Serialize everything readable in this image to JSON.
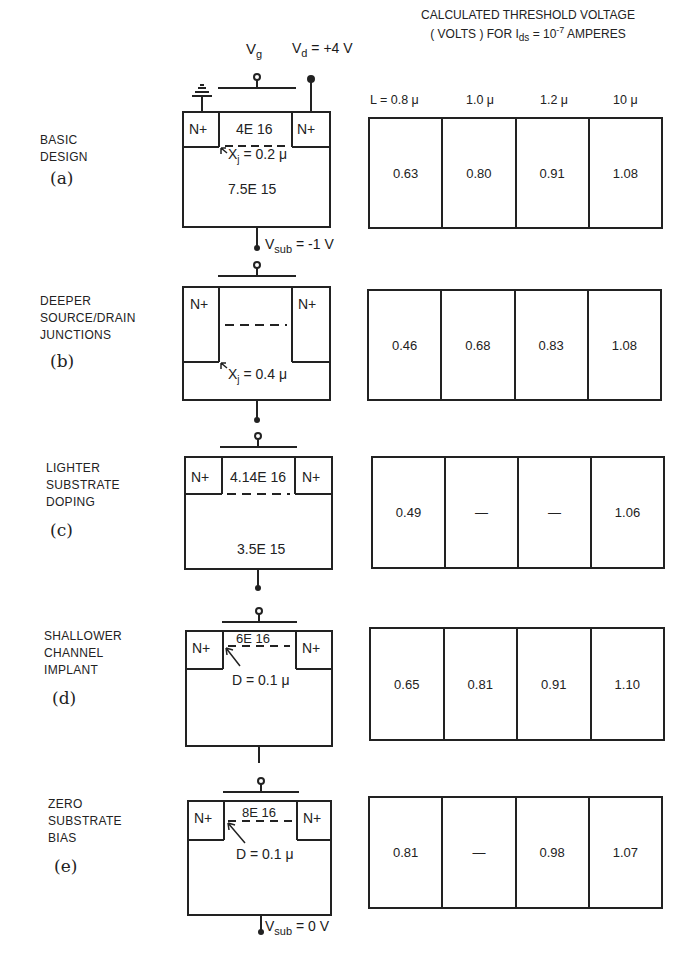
{
  "header": {
    "line1": "CALCULATED THRESHOLD VOLTAGE",
    "line2_prefix": "( VOLTS ) FOR  I",
    "line2_sub": "ds",
    "line2_mid": " = 10",
    "line2_sup": "-7",
    "line2_suffix": " AMPERES"
  },
  "columns": [
    "L = 0.8 μ",
    "1.0 μ",
    "1.2 μ",
    "10 μ"
  ],
  "terminals": {
    "vg": "V",
    "vg_sub": "g",
    "vd": "V",
    "vd_sub": "d",
    "vd_value": " = +4 V",
    "vsub_a": "V",
    "vsub_a_sub": "sub",
    "vsub_a_value": " = -1 V",
    "vsub_e": "V",
    "vsub_e_sub": "sub",
    "vsub_e_value": " = 0 V"
  },
  "rows": [
    {
      "id": "a",
      "title_lines": [
        "BASIC",
        "DESIGN"
      ],
      "tag": "(a)",
      "device": {
        "source": "N+",
        "drain": "N+",
        "channel": "4E 16",
        "junction": "X",
        "junction_sub": "j",
        "junction_value": " = 0.2 μ",
        "substrate": "7.5E 15"
      },
      "values": [
        "0.63",
        "0.80",
        "0.91",
        "1.08"
      ]
    },
    {
      "id": "b",
      "title_lines": [
        "DEEPER",
        "SOURCE/DRAIN",
        "JUNCTIONS"
      ],
      "tag": "(b)",
      "device": {
        "source": "N+",
        "drain": "N+",
        "junction": "X",
        "junction_sub": "j",
        "junction_value": " = 0.4 μ"
      },
      "values": [
        "0.46",
        "0.68",
        "0.83",
        "1.08"
      ]
    },
    {
      "id": "c",
      "title_lines": [
        "LIGHTER",
        "SUBSTRATE",
        "DOPING"
      ],
      "tag": "(c)",
      "device": {
        "source": "N+",
        "drain": "N+",
        "channel": "4.14E 16",
        "substrate": "3.5E 15"
      },
      "values": [
        "0.49",
        "—",
        "—",
        "1.06"
      ]
    },
    {
      "id": "d",
      "title_lines": [
        "SHALLOWER",
        "CHANNEL",
        "IMPLANT"
      ],
      "tag": "(d)",
      "device": {
        "source": "N+",
        "drain": "N+",
        "channel": "6E 16",
        "depth": "D = 0.1 μ"
      },
      "values": [
        "0.65",
        "0.81",
        "0.91",
        "1.10"
      ]
    },
    {
      "id": "e",
      "title_lines": [
        "ZERO",
        "SUBSTRATE",
        "BIAS"
      ],
      "tag": "(e)",
      "device": {
        "source": "N+",
        "drain": "N+",
        "channel": "8E 16",
        "depth": "D = 0.1 μ"
      },
      "values": [
        "0.81",
        "—",
        "0.98",
        "1.07"
      ]
    }
  ]
}
